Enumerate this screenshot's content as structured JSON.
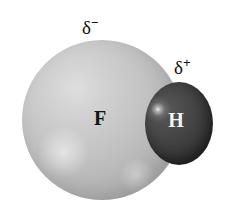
{
  "figure": {
    "background_color": "#ffffff",
    "width": 228,
    "height": 214
  },
  "atoms": [
    {
      "id": "fluorine",
      "symbol": "F",
      "role": "partially-negative-atom",
      "color": "#bcbcbc",
      "label_color": "#141414",
      "relative_size": "large"
    },
    {
      "id": "hydrogen",
      "symbol": "H",
      "role": "partially-positive-atom",
      "color": "#3e3e3e",
      "label_color": "#f4f4f4",
      "relative_size": "small"
    }
  ],
  "charge_labels": [
    {
      "id": "delta-negative",
      "greek": "δ",
      "sign": "−",
      "full": "δ−",
      "points_to": "fluorine"
    },
    {
      "id": "delta-positive",
      "greek": "δ",
      "sign": "+",
      "full": "δ+",
      "points_to": "hydrogen"
    }
  ]
}
